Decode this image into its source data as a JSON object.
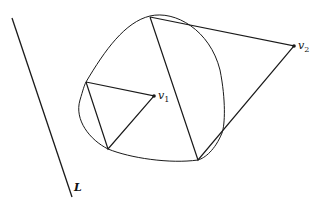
{
  "diagram": {
    "labels": {
      "line": "L",
      "v1": "v",
      "v1_sub": "1",
      "v2": "v",
      "v2_sub": "2"
    },
    "colors": {
      "stroke": "#1a1a1a",
      "background": "#ffffff"
    }
  }
}
